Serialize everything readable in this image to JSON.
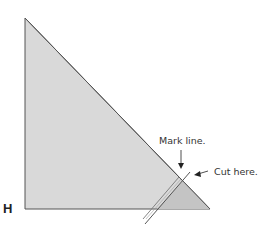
{
  "diagram": {
    "corner_label": "H",
    "annotations": {
      "mark_line": "Mark line.",
      "cut_here": "Cut here."
    },
    "colors": {
      "triangle_fill": "#d9d9d9",
      "trim_fill": "#c4c4c4",
      "stroke": "#555555"
    }
  }
}
